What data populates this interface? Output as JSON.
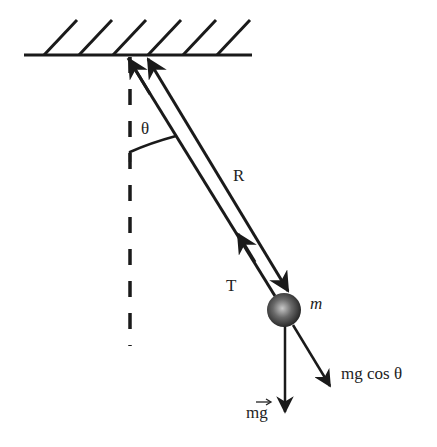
{
  "diagram": {
    "type": "simple-pendulum-force-diagram",
    "colors": {
      "ink": "#1a1a1a",
      "background": "#ffffff",
      "bob_light": "#b5b5b5",
      "bob_dark": "#222222"
    },
    "labels": {
      "angle": "θ",
      "length": "R",
      "tension": "T",
      "mass": "m",
      "weight": "mg",
      "weight_component": "mg cos θ"
    },
    "elements": [
      "ceiling-with-hatching",
      "vertical-dashed-reference-line",
      "angle-arc",
      "string",
      "tension-arrow",
      "length-arrow",
      "bob",
      "weight-arrow",
      "radial-component-arrow"
    ]
  }
}
